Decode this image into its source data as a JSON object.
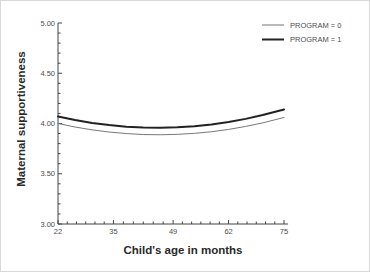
{
  "figure": {
    "xlabel": "Child's age in months",
    "ylabel": "Maternal supportiveness"
  },
  "colors": {
    "axis": "#444444",
    "tick_text": "#4d4d4d",
    "title_text": "#2a2a2a",
    "background": "#ffffff",
    "frame_border": "#d9d9d9"
  },
  "chart_data": {
    "type": "line",
    "title": "",
    "xlabel": "Child's age in months",
    "ylabel": "Maternal supportiveness",
    "xlim": [
      22,
      75
    ],
    "ylim": [
      3.0,
      5.0
    ],
    "x_ticks": [
      22,
      35,
      49,
      62,
      75
    ],
    "x_tick_labels": [
      "22",
      "35",
      "49",
      "62",
      "75"
    ],
    "y_ticks": [
      3.0,
      3.5,
      4.0,
      4.5,
      5.0
    ],
    "y_tick_labels": [
      "3.00",
      "3.50",
      "4.00",
      "4.50",
      "5.00"
    ],
    "x_minor_divisions_per_major": 6,
    "y_minor_step": 0.1,
    "grid": false,
    "legend_position": "top-right",
    "x": [
      22,
      26,
      30,
      34,
      38,
      42,
      46,
      50,
      54,
      58,
      62,
      66,
      70,
      75
    ],
    "series": [
      {
        "name": "PROGRAM = 0",
        "color": "#777777",
        "line_width": 1,
        "values": [
          4.0,
          3.965,
          3.937,
          3.915,
          3.9,
          3.89,
          3.888,
          3.892,
          3.902,
          3.918,
          3.941,
          3.971,
          4.006,
          4.06
        ]
      },
      {
        "name": "PROGRAM = 1",
        "color": "#222222",
        "line_width": 2,
        "values": [
          4.07,
          4.035,
          4.006,
          3.984,
          3.968,
          3.959,
          3.957,
          3.962,
          3.973,
          3.991,
          4.015,
          4.046,
          4.084,
          4.14
        ]
      }
    ]
  }
}
